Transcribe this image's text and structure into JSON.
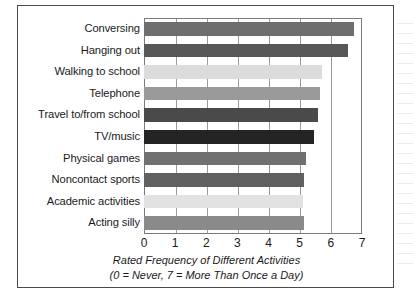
{
  "chart_data": {
    "type": "bar",
    "orientation": "horizontal",
    "title": "",
    "xlabel": "Rated Frequency of Different Activities",
    "xlabel_note": "(0 = Never,  7 = More Than Once a Day)",
    "ylabel": "",
    "xlim": [
      0,
      7
    ],
    "xticks": [
      0,
      1,
      2,
      3,
      4,
      5,
      6,
      7
    ],
    "xtick_labels": [
      "0",
      "1",
      "2",
      "3",
      "4",
      "5",
      "6",
      "7"
    ],
    "grid": true,
    "grid_axis": "x",
    "legend": false,
    "categories": [
      "Conversing",
      "Hanging out",
      "Walking to school",
      "Telephone",
      "Travel to/from school",
      "TV/music",
      "Physical games",
      "Noncontact sports",
      "Academic activities",
      "Acting silly"
    ],
    "values": [
      6.75,
      6.55,
      5.7,
      5.65,
      5.6,
      5.45,
      5.2,
      5.15,
      5.1,
      5.15
    ],
    "bar_colors": [
      "#6e6e6e",
      "#575757",
      "#dcdcdc",
      "#9a9a9a",
      "#4a4a4a",
      "#242424",
      "#707070",
      "#606060",
      "#e2e2e2",
      "#8a8a8a"
    ],
    "bars": [
      {
        "label": "Conversing",
        "value": 6.75,
        "color": "#6e6e6e"
      },
      {
        "label": "Hanging out",
        "value": 6.55,
        "color": "#575757"
      },
      {
        "label": "Walking to school",
        "value": 5.7,
        "color": "#dcdcdc"
      },
      {
        "label": "Telephone",
        "value": 5.65,
        "color": "#9a9a9a"
      },
      {
        "label": "Travel to/from school",
        "value": 5.6,
        "color": "#4a4a4a"
      },
      {
        "label": "TV/music",
        "value": 5.45,
        "color": "#242424"
      },
      {
        "label": "Physical games",
        "value": 5.2,
        "color": "#707070"
      },
      {
        "label": "Noncontact sports",
        "value": 5.15,
        "color": "#606060"
      },
      {
        "label": "Academic activities",
        "value": 5.1,
        "color": "#e2e2e2"
      },
      {
        "label": "Acting silly",
        "value": 5.15,
        "color": "#8a8a8a"
      }
    ]
  },
  "style": {
    "frame_color": "#4a4a4a",
    "plot_border_color": "#7a7a7a",
    "gridline_color": "#9a9a9a",
    "text_color": "#1a1a1a",
    "background": "#ffffff"
  }
}
